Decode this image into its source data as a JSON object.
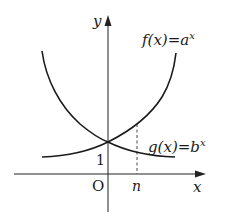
{
  "diagram": {
    "axes": {
      "x_label": "x",
      "y_label": "y",
      "origin_label": "O",
      "y_intercept_label": "1",
      "x_marker_label": "n"
    },
    "curves": [
      {
        "name": "f",
        "func": "f",
        "var": "x",
        "base": "a",
        "exp": "x",
        "trend": "increasing"
      },
      {
        "name": "g",
        "func": "g",
        "var": "x",
        "base": "b",
        "exp": "x",
        "trend": "decreasing"
      }
    ],
    "labels": {
      "f_text": "f(x)=a",
      "f_exp": "x",
      "g_text": "g(x)=b",
      "g_exp": "x"
    },
    "colors": {
      "stroke": "#1a1a1a",
      "background": "#ffffff"
    }
  }
}
